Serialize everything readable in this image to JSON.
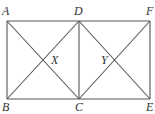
{
  "diagram": {
    "points": {
      "A": {
        "x": 7,
        "y": 21
      },
      "D": {
        "x": 79,
        "y": 21
      },
      "F": {
        "x": 150,
        "y": 21
      },
      "B": {
        "x": 7,
        "y": 99
      },
      "C": {
        "x": 79,
        "y": 99
      },
      "E": {
        "x": 150,
        "y": 99
      },
      "X": {
        "x": 43,
        "y": 60
      },
      "Y": {
        "x": 114.5,
        "y": 60
      }
    },
    "labels": {
      "A": "A",
      "B": "B",
      "C": "C",
      "D": "D",
      "E": "E",
      "F": "F",
      "X": "X",
      "Y": "Y"
    },
    "segments": [
      [
        "A",
        "F"
      ],
      [
        "B",
        "E"
      ],
      [
        "A",
        "B"
      ],
      [
        "D",
        "C"
      ],
      [
        "F",
        "E"
      ],
      [
        "A",
        "C"
      ],
      [
        "B",
        "D"
      ],
      [
        "D",
        "E"
      ],
      [
        "C",
        "F"
      ]
    ],
    "line_color": "#555555",
    "label_color": "#333333"
  }
}
